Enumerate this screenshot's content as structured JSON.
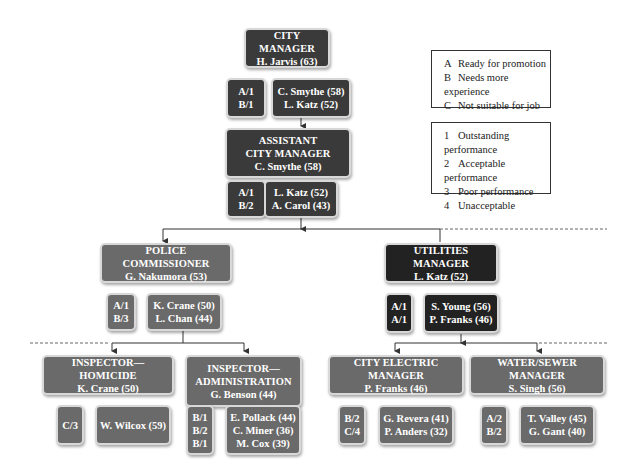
{
  "legend_rating": {
    "items": [
      {
        "key": "A",
        "label": "Ready for promotion"
      },
      {
        "key": "B",
        "label": "Needs more experience"
      },
      {
        "key": "C",
        "label": "Not suitable for job"
      }
    ]
  },
  "legend_performance": {
    "items": [
      {
        "key": "1",
        "label": "Outstanding performance"
      },
      {
        "key": "2",
        "label": "Acceptable performance"
      },
      {
        "key": "3",
        "label": "Poor performance"
      },
      {
        "key": "4",
        "label": "Unacceptable"
      }
    ]
  },
  "city_manager": {
    "title": "CITY MANAGER",
    "name": "H. Jarvis (63)",
    "ratings": [
      "A/1",
      "B/1"
    ],
    "candidates": [
      "C. Smythe (58)",
      "L. Katz (52)"
    ]
  },
  "assistant_city_manager": {
    "title_line1": "ASSISTANT",
    "title_line2": "CITY MANAGER",
    "name": "C. Smythe (58)",
    "ratings": [
      "A/1",
      "B/2"
    ],
    "candidates": [
      "L. Katz (52)",
      "A. Carol (43)"
    ]
  },
  "police_commissioner": {
    "title": "POLICE COMMISSIONER",
    "name": "G. Nakumora (53)",
    "ratings": [
      "A/1",
      "B/3"
    ],
    "candidates": [
      "K. Crane (50)",
      "L. Chan (44)"
    ]
  },
  "utilities_manager": {
    "title": "UTILITIES MANAGER",
    "name": "L. Katz (52)",
    "ratings": [
      "A/1",
      "A/1"
    ],
    "candidates": [
      "S. Young (56)",
      "P. Franks (46)"
    ]
  },
  "inspector_homicide": {
    "title": "INSPECTOR—HOMICIDE",
    "name": "K. Crane (50)",
    "ratings": [
      "C/3"
    ],
    "candidates": [
      "W. Wilcox (59)"
    ]
  },
  "inspector_administration": {
    "title_line1": "INSPECTOR—",
    "title_line2": "ADMINISTRATION",
    "name": "G. Benson (44)",
    "ratings": [
      "B/1",
      "B/2",
      "B/1"
    ],
    "candidates": [
      "E. Pollack (44)",
      "C. Miner (36)",
      "M. Cox (39)"
    ]
  },
  "city_electric_manager": {
    "title": "CITY ELECTRIC MANAGER",
    "name": "P. Franks (46)",
    "ratings": [
      "B/2",
      "C/4"
    ],
    "candidates": [
      "G. Revera (41)",
      "P. Anders (32)"
    ]
  },
  "water_sewer_manager": {
    "title": "WATER/SEWER MANAGER",
    "name": "S. Singh (56)",
    "ratings": [
      "A/2",
      "B/2"
    ],
    "candidates": [
      "T. Valley (45)",
      "G. Gant (40)"
    ]
  },
  "colors": {
    "dark_box": "#3a3a3a",
    "mid_box": "#6a6a6a",
    "black_box": "#222222",
    "line": "#333333"
  }
}
